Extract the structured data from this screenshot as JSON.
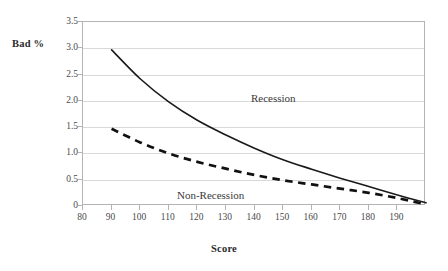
{
  "chart_data": {
    "type": "line",
    "title": "",
    "xlabel": "Score",
    "ylabel": "Bad %",
    "xlim": [
      80,
      200
    ],
    "ylim": [
      0,
      3.5
    ],
    "grid": true,
    "legend_position": "inline-annotation",
    "x_ticks": [
      80,
      90,
      100,
      110,
      120,
      130,
      140,
      150,
      160,
      170,
      180,
      190
    ],
    "y_ticks": [
      "0",
      "0.5",
      "1.0",
      "1.5",
      "2.0",
      "2.5",
      "3.0",
      "3.5"
    ],
    "y_tick_values": [
      0,
      0.5,
      1.0,
      1.5,
      2.0,
      2.5,
      3.0,
      3.5
    ],
    "x": [
      90,
      100,
      110,
      120,
      130,
      140,
      150,
      160,
      170,
      180,
      190,
      200
    ],
    "series": [
      {
        "name": "Recession",
        "style": "solid",
        "color": "#1a1a1a",
        "values": [
          2.97,
          2.42,
          1.98,
          1.63,
          1.35,
          1.1,
          0.88,
          0.7,
          0.53,
          0.37,
          0.21,
          0.06
        ]
      },
      {
        "name": "Non-Recession",
        "style": "dashed",
        "color": "#111111",
        "values": [
          1.47,
          1.21,
          1.0,
          0.84,
          0.71,
          0.59,
          0.49,
          0.41,
          0.33,
          0.25,
          0.15,
          0.03
        ]
      }
    ],
    "annotations": [
      {
        "text": "Recession",
        "x": 133,
        "y": 2.25
      },
      {
        "text": "Non-Recession",
        "x": 104,
        "y": 0.55
      }
    ]
  },
  "axes": {
    "y_title": "Bad %",
    "x_title": "Score"
  },
  "colors": {
    "plot_border": "#b4b4b4",
    "gridline": "#d9d9d9",
    "text": "#3a3a3a",
    "series_solid": "#1a1a1a",
    "series_dashed": "#111111",
    "background": "#ffffff"
  }
}
